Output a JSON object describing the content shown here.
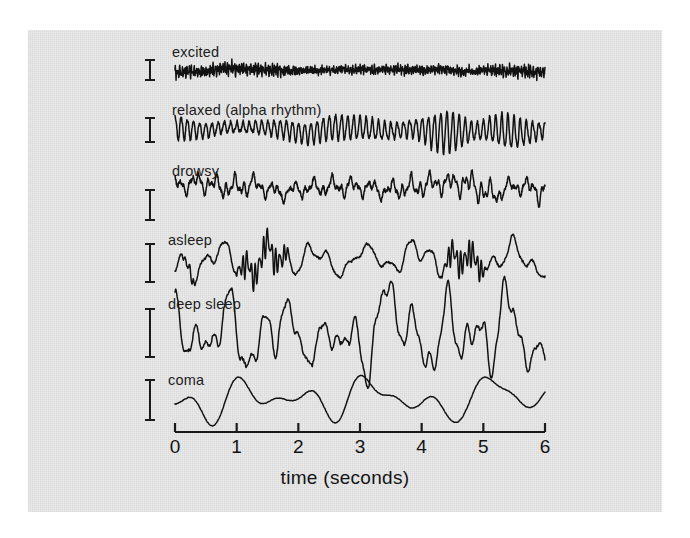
{
  "figure": {
    "background_color": "#e8e8e8",
    "page_color": "#ffffff",
    "ink_color": "#121212"
  },
  "chart_data": {
    "type": "line",
    "title": "",
    "subtitle": "",
    "xlabel": "time (seconds)",
    "ylabel": "",
    "xlim": [
      0,
      6
    ],
    "xticks": [
      0,
      1,
      2,
      3,
      4,
      5,
      6
    ],
    "xtick_labels": [
      "0",
      "1",
      "2",
      "3",
      "4",
      "5",
      "6"
    ],
    "grid": false,
    "legend_position": "none",
    "annotations": [
      "excited",
      "relaxed (alpha rhythm)",
      "drowsy",
      "asleep",
      "deep sleep",
      "coma"
    ],
    "series": [
      {
        "name": "excited",
        "label": "excited",
        "baseline_y": 70,
        "amplitude_px": 5,
        "dominant_frequency_hz": 26,
        "scalebar_height_px": 20,
        "scalebar_center_y": 70,
        "description": "low-amplitude high-frequency beta activity"
      },
      {
        "name": "relaxed",
        "label": "relaxed (alpha rhythm)",
        "baseline_y": 130,
        "amplitude_px": 13,
        "dominant_frequency_hz": 10,
        "scalebar_height_px": 24,
        "scalebar_center_y": 130,
        "description": "regular 10 Hz alpha rhythm with waxing and waning spindles"
      },
      {
        "name": "drowsy",
        "label": "drowsy",
        "baseline_y": 188,
        "amplitude_px": 8,
        "dominant_frequency_hz": 7,
        "scalebar_height_px": 30,
        "scalebar_center_y": 205,
        "description": "mixed theta activity of moderate amplitude"
      },
      {
        "name": "asleep",
        "label": "asleep",
        "baseline_y": 262,
        "amplitude_px": 11,
        "dominant_frequency_hz": 3,
        "scalebar_height_px": 38,
        "scalebar_center_y": 263,
        "description": "slow waves interrupted by fast sleep spindles"
      },
      {
        "name": "deep sleep",
        "label": "deep sleep",
        "baseline_y": 333,
        "amplitude_px": 22,
        "dominant_frequency_hz": 2,
        "scalebar_height_px": 48,
        "scalebar_center_y": 333,
        "description": "large slow delta waves"
      },
      {
        "name": "coma",
        "label": "coma",
        "baseline_y": 400,
        "amplitude_px": 14,
        "dominant_frequency_hz": 1,
        "scalebar_height_px": 40,
        "scalebar_center_y": 400,
        "description": "very slow smooth low frequency waves"
      }
    ]
  },
  "axis": {
    "x_start_px": 175,
    "x_end_px": 545,
    "y_px": 432,
    "tick_length_px": 9,
    "title": "time (seconds)"
  },
  "labels": {
    "excited": "excited",
    "relaxed": "relaxed (alpha rhythm)",
    "drowsy": "drowsy",
    "asleep": "asleep",
    "deep_sleep": "deep sleep",
    "coma": "coma"
  }
}
